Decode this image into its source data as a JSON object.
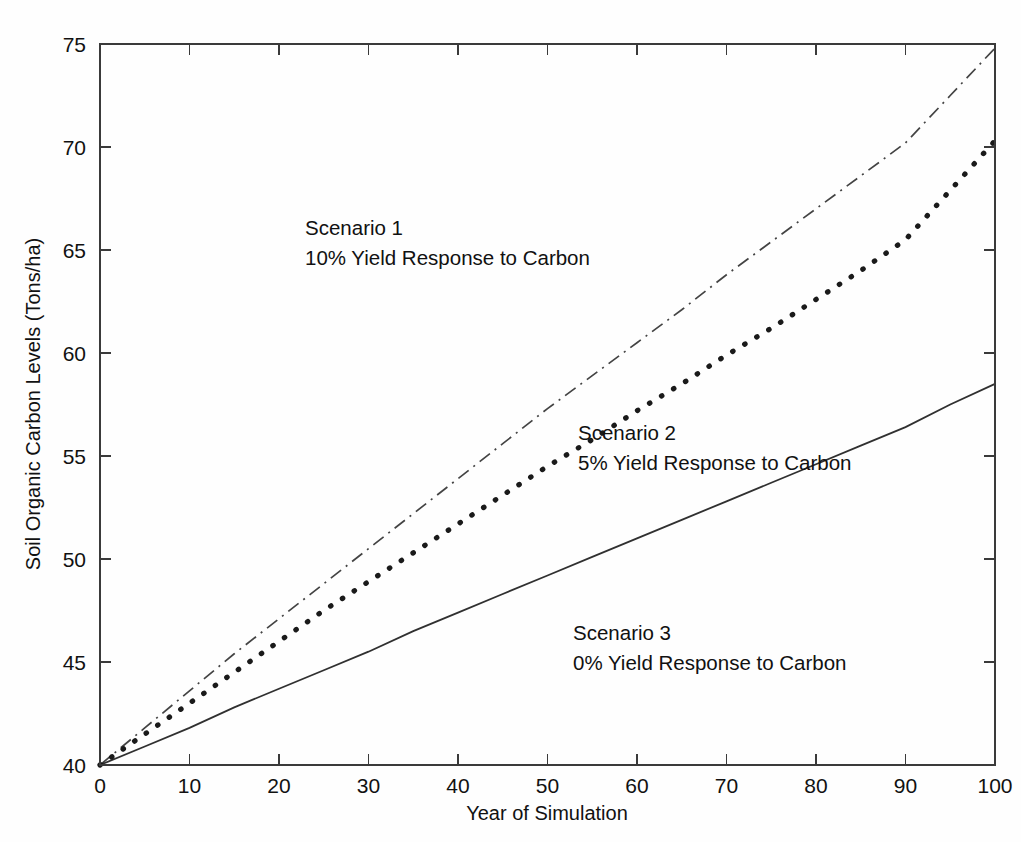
{
  "chart_data": {
    "type": "line",
    "title": "",
    "xlabel": "Year of Simulation",
    "ylabel": "Soil Organic Carbon Levels (Tons/ha)",
    "xlim": [
      0,
      100
    ],
    "ylim": [
      40,
      75
    ],
    "xticks": [
      0,
      10,
      20,
      30,
      40,
      50,
      60,
      70,
      80,
      90,
      100
    ],
    "yticks": [
      40,
      45,
      50,
      55,
      60,
      65,
      70,
      75
    ],
    "grid": false,
    "legend_position": "none",
    "x": [
      0,
      5,
      10,
      15,
      20,
      25,
      30,
      35,
      40,
      45,
      50,
      55,
      60,
      65,
      70,
      75,
      80,
      85,
      90,
      95,
      100
    ],
    "series": [
      {
        "name": "Scenario 1",
        "style": "dash-dot",
        "values": [
          40.0,
          41.8,
          43.6,
          45.4,
          47.1,
          48.8,
          50.5,
          52.2,
          53.9,
          55.6,
          57.3,
          58.9,
          60.5,
          62.1,
          63.8,
          65.4,
          67.0,
          68.6,
          70.2,
          72.5,
          74.8
        ]
      },
      {
        "name": "Scenario 2",
        "style": "dotted",
        "values": [
          40.0,
          41.5,
          43.0,
          44.5,
          46.0,
          47.5,
          48.9,
          50.3,
          51.7,
          53.1,
          54.5,
          55.8,
          57.2,
          58.5,
          59.9,
          61.2,
          62.6,
          64.0,
          65.5,
          67.9,
          70.3
        ]
      },
      {
        "name": "Scenario 3",
        "style": "solid",
        "values": [
          40.0,
          40.9,
          41.8,
          42.8,
          43.7,
          44.6,
          45.5,
          46.5,
          47.4,
          48.3,
          49.2,
          50.1,
          51.0,
          51.9,
          52.8,
          53.7,
          54.6,
          55.5,
          56.4,
          57.5,
          58.5
        ]
      }
    ],
    "annotations": [
      {
        "id": "scenario-1",
        "line1": "Scenario 1",
        "line2": "10% Yield Response to Carbon",
        "x_px": 305,
        "y_px": 235
      },
      {
        "id": "scenario-2",
        "line1": "Scenario 2",
        "line2": "5% Yield Response to Carbon",
        "x_px": 578,
        "y_px": 440
      },
      {
        "id": "scenario-3",
        "line1": "Scenario 3",
        "line2": "0% Yield Response to Carbon",
        "x_px": 573,
        "y_px": 640
      }
    ]
  },
  "colors": {
    "background": "#fefefe",
    "axis": "#3a3a3a",
    "text": "#111111",
    "series": "#1a1a1a"
  }
}
